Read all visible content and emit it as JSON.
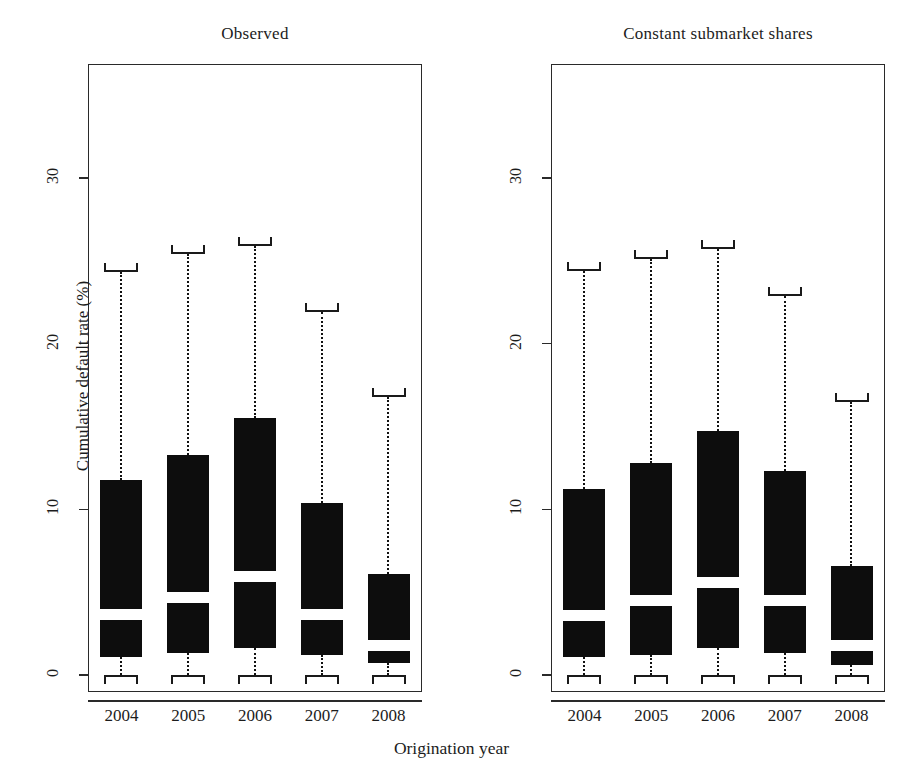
{
  "figure": {
    "width": 903,
    "height": 774,
    "background": "#ffffff",
    "ink": "#0d0d0d",
    "box_fill": "#0d0d0d",
    "median_fill": "#ffffff"
  },
  "axis": {
    "xlabel": "Origination year",
    "ylabel": "Cumulative default rate (%)",
    "yticks": [
      0,
      10,
      20,
      30
    ],
    "ytick_labels": [
      "0",
      "10",
      "20",
      "30"
    ],
    "xticks": [
      "2004",
      "2005",
      "2006",
      "2007",
      "2008"
    ]
  },
  "chart_data": {
    "type": "box",
    "title": "",
    "xlabel": "Origination year",
    "ylabel": "Cumulative default rate (%)",
    "ylim": [
      -1.2,
      35.5
    ],
    "yticks": [
      0,
      10,
      20,
      30
    ],
    "grid": false,
    "legend": "none",
    "categories": [
      "2004",
      "2005",
      "2006",
      "2007",
      "2008"
    ],
    "panels": [
      {
        "label": "Observed",
        "boxes": [
          {
            "category": "2004",
            "whisker_low": 0.0,
            "q1": 1.1,
            "median": 3.7,
            "q3": 11.8,
            "whisker_high": 24.3
          },
          {
            "category": "2005",
            "whisker_low": 0.0,
            "q1": 1.3,
            "median": 4.7,
            "q3": 13.3,
            "whisker_high": 25.4
          },
          {
            "category": "2006",
            "whisker_low": 0.0,
            "q1": 1.6,
            "median": 6.0,
            "q3": 15.5,
            "whisker_high": 25.9
          },
          {
            "category": "2007",
            "whisker_low": 0.0,
            "q1": 1.2,
            "median": 3.7,
            "q3": 10.4,
            "whisker_high": 21.9
          },
          {
            "category": "2008",
            "whisker_low": 0.0,
            "q1": 0.7,
            "median": 1.8,
            "q3": 6.1,
            "whisker_high": 16.8
          }
        ]
      },
      {
        "label": "Constant submarket shares",
        "boxes": [
          {
            "category": "2004",
            "whisker_low": 0.0,
            "q1": 1.1,
            "median": 3.6,
            "q3": 11.2,
            "whisker_high": 24.4
          },
          {
            "category": "2005",
            "whisker_low": 0.0,
            "q1": 1.2,
            "median": 4.5,
            "q3": 12.8,
            "whisker_high": 25.1
          },
          {
            "category": "2006",
            "whisker_low": 0.0,
            "q1": 1.6,
            "median": 5.6,
            "q3": 14.7,
            "whisker_high": 25.7
          },
          {
            "category": "2007",
            "whisker_low": 0.0,
            "q1": 1.3,
            "median": 4.5,
            "q3": 12.3,
            "whisker_high": 22.9
          },
          {
            "category": "2008",
            "whisker_low": 0.0,
            "q1": 0.6,
            "median": 1.8,
            "q3": 6.6,
            "whisker_high": 16.5
          }
        ]
      }
    ]
  }
}
